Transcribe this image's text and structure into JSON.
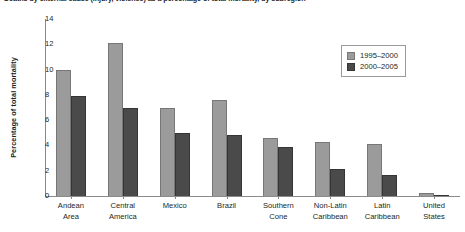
{
  "caption": "Deaths by external cause (injury, violence) as a percentage of total mortality, by subregion",
  "chart_data": {
    "type": "bar",
    "title": "",
    "xlabel": "",
    "ylabel": "Percentage of total mortality",
    "ylim": [
      0,
      14
    ],
    "yticks": [
      0,
      2,
      4,
      6,
      8,
      10,
      12,
      14
    ],
    "grid": false,
    "legend_position": "top-right",
    "categories": [
      "Andean\nArea",
      "Central\nAmerica",
      "Mexico",
      "Brazil",
      "Southern\nCone",
      "Non-Latin\nCaribbean",
      "Latin\nCaribbean",
      "United\nStates"
    ],
    "series": [
      {
        "name": "1995–2000",
        "color": "#9b9b9b",
        "values": [
          10.0,
          12.1,
          7.0,
          7.6,
          4.6,
          4.3,
          4.1,
          0.2
        ]
      },
      {
        "name": "2000–2005",
        "color": "#4a4a4a",
        "values": [
          7.9,
          7.0,
          5.0,
          4.8,
          3.9,
          2.1,
          1.7,
          0.1
        ]
      }
    ]
  }
}
